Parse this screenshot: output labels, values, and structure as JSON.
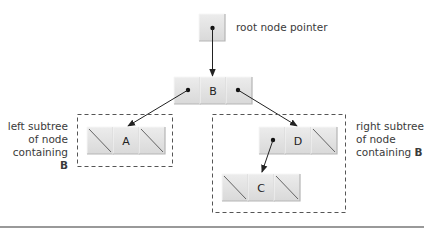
{
  "diagram": {
    "type": "binary-tree-node-diagram",
    "root_pointer": {
      "label": "root node pointer"
    },
    "nodes": [
      {
        "id": "B",
        "value": "B",
        "left": "A",
        "right": "D"
      },
      {
        "id": "A",
        "value": "A",
        "left": null,
        "right": null
      },
      {
        "id": "D",
        "value": "D",
        "left": "C",
        "right": null
      },
      {
        "id": "C",
        "value": "C",
        "left": null,
        "right": null
      }
    ],
    "subtrees": {
      "left": {
        "line1": "left subtree",
        "line2": "of node",
        "line3_prefix": "containing ",
        "line3_bold": "B"
      },
      "right": {
        "line1": "right subtree",
        "line2": "of node",
        "line3_prefix": "containing ",
        "line3_bold": "B"
      }
    },
    "colors": {
      "cell_fill": "#e2e2e2",
      "cell_highlight": "#f2f2f2",
      "cell_shadow": "#b8b8b8",
      "arrow": "#222222",
      "dashed_border": "#555555",
      "rule": "#777777"
    }
  }
}
